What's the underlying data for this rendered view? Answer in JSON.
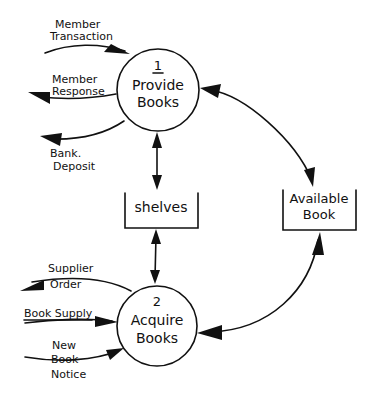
{
  "colors": {
    "ink": "#111111",
    "background": "#ffffff"
  },
  "processes": [
    {
      "id": "1",
      "number": "1",
      "line1": "Provide",
      "line2": "Books"
    },
    {
      "id": "2",
      "number": "2",
      "line1": "Acquire",
      "line2": "Books"
    }
  ],
  "data_stores": [
    {
      "id": "shelves",
      "line1": "shelves"
    },
    {
      "id": "available-book",
      "line1": "Available",
      "line2": "Book"
    }
  ],
  "flows": {
    "member_transaction": {
      "line1": "Member",
      "line2": "Transaction",
      "direction": "in",
      "target": "1"
    },
    "member_response": {
      "line1": "Member",
      "line2": "Response",
      "direction": "out",
      "source": "1"
    },
    "bank_deposit": {
      "line1": "Bank.",
      "line2": "Deposit",
      "direction": "out",
      "source": "1"
    },
    "supplier_order": {
      "line1": "Supplier",
      "line2": "Order",
      "direction": "out",
      "source": "2"
    },
    "book_supply": {
      "line1": "Book Supply",
      "direction": "in",
      "target": "2"
    },
    "new_book_notice": {
      "line1": "New",
      "line2": "Book",
      "line3": "Notice",
      "direction": "in",
      "target": "2"
    }
  },
  "connections": [
    {
      "from": "1",
      "to": "shelves",
      "bidirectional": true
    },
    {
      "from": "shelves",
      "to": "2",
      "bidirectional": true
    },
    {
      "from": "1",
      "to": "available-book",
      "bidirectional": true
    },
    {
      "from": "available-book",
      "to": "2",
      "bidirectional": true
    }
  ]
}
